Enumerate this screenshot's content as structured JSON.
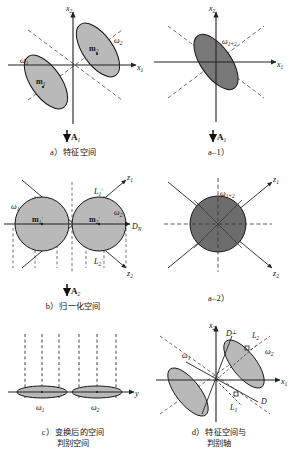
{
  "figure": {
    "title_present": false,
    "colors": {
      "fill_light": "#b9b9b9",
      "fill_dark": "#6d6d6d",
      "stroke": "#151515",
      "axis": "#202020",
      "dashed": "#303030",
      "background": "#ffffff"
    }
  },
  "panels": {
    "a": {
      "caption_label": "a）",
      "caption_text": "特征空间",
      "transform_label": "A",
      "transform_sub": "1",
      "axes": [
        {
          "name": "x1",
          "label": "x",
          "sub": "1"
        },
        {
          "name": "x2",
          "label": "x",
          "sub": "2"
        }
      ],
      "clusters": [
        {
          "name": "omega1",
          "label": "ω",
          "sub": "1",
          "mean_label": "m",
          "mean_sub": "1"
        },
        {
          "name": "omega2",
          "label": "ω",
          "sub": "2",
          "mean_label": "m",
          "mean_sub": "2"
        }
      ]
    },
    "a1": {
      "caption_label": "a–1）",
      "caption_text": "",
      "transform_label": "A",
      "transform_sub": "1",
      "axes": [
        {
          "name": "x1",
          "label": "x",
          "sub": "1"
        },
        {
          "name": "x2",
          "label": "x",
          "sub": "2"
        }
      ],
      "clusters": [
        {
          "name": "omega1plus2",
          "label": "ω",
          "sub": "1+2"
        }
      ]
    },
    "b": {
      "caption_label": "b）",
      "caption_text": "归一化空间",
      "transform_label": "A",
      "transform_sub": "2",
      "axes": [
        {
          "name": "z1",
          "label": "z",
          "sub": "1"
        },
        {
          "name": "z2",
          "label": "z",
          "sub": "2"
        },
        {
          "name": "DN",
          "label": "D",
          "sub": "N"
        }
      ],
      "clusters": [
        {
          "name": "omega1",
          "label": "ω",
          "sub": "1",
          "mean_label": "m",
          "mean_sub": "1",
          "mean_prime": "′"
        },
        {
          "name": "omega2",
          "label": "ω",
          "sub": "2",
          "mean_label": "m",
          "mean_sub": "2",
          "mean_prime": "′"
        }
      ],
      "tangents": [
        {
          "name": "L1prime",
          "label": "L",
          "sub": "1",
          "prime": "′"
        },
        {
          "name": "L2prime",
          "label": "L",
          "sub": "2",
          "prime": "′"
        }
      ]
    },
    "a2": {
      "caption_label": "a–2）",
      "caption_text": "",
      "axes": [
        {
          "name": "z1",
          "label": "z",
          "sub": "1"
        },
        {
          "name": "z2",
          "label": "z",
          "sub": "2"
        }
      ],
      "clusters": [
        {
          "name": "omega1plus2",
          "label": "ω",
          "sub": "1+2"
        }
      ]
    },
    "c": {
      "caption_label": "c）",
      "caption_text": "变换后的空间",
      "caption_text2": "判别空间",
      "axes": [
        {
          "name": "y",
          "label": "y",
          "sub": ""
        }
      ],
      "clusters": [
        {
          "name": "omega1",
          "label": "ω",
          "sub": "1"
        },
        {
          "name": "omega2",
          "label": "ω",
          "sub": "2"
        }
      ],
      "projection_lines": 6
    },
    "d": {
      "caption_label": "d）",
      "caption_text": "特征空间与",
      "caption_text2": "判别轴",
      "axes": [
        {
          "name": "x1",
          "label": "x",
          "sub": "1"
        },
        {
          "name": "x2",
          "label": "x",
          "sub": "2"
        }
      ],
      "clusters": [
        {
          "name": "omega1",
          "label": "ω",
          "sub": "1"
        },
        {
          "name": "omega2",
          "label": "ω",
          "sub": "2"
        }
      ],
      "discriminant_axes": [
        {
          "name": "Dperp",
          "label": "D",
          "sup": "⊥"
        },
        {
          "name": "D",
          "label": "D",
          "sup": ""
        },
        {
          "name": "L1",
          "label": "L",
          "sub": "1"
        },
        {
          "name": "L2",
          "label": "L",
          "sub": "2"
        }
      ]
    }
  }
}
